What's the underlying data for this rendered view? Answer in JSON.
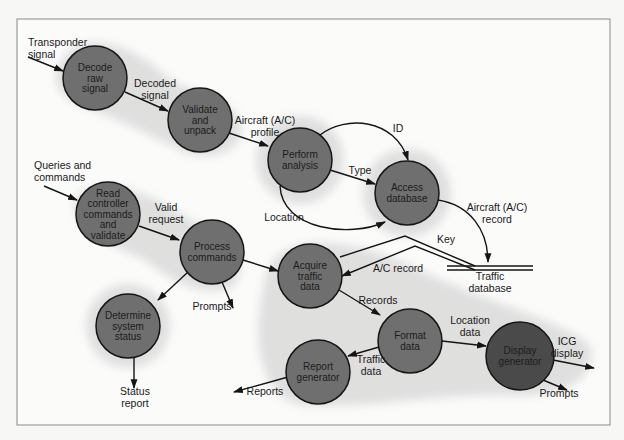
{
  "diagram": {
    "type": "data-flow-diagram",
    "frame": {
      "x": 17,
      "y": 19,
      "w": 593,
      "h": 406
    },
    "colors": {
      "node_fill": "#6f6f6f",
      "node_dark_fill": "#4a4a4a",
      "halo": "#dcdcdc",
      "line": "#151515",
      "background": "#fbfbfa"
    },
    "nodes": [
      {
        "id": "decode",
        "lines": [
          "Decode",
          "raw",
          "signal"
        ],
        "cx": 95,
        "cy": 78,
        "r": 32
      },
      {
        "id": "validate",
        "lines": [
          "Validate",
          "and",
          "unpack"
        ],
        "cx": 200,
        "cy": 120,
        "r": 32
      },
      {
        "id": "analysis",
        "lines": [
          "Perform",
          "analysis"
        ],
        "cx": 300,
        "cy": 160,
        "r": 32
      },
      {
        "id": "access",
        "lines": [
          "Access",
          "database"
        ],
        "cx": 407,
        "cy": 193,
        "r": 32
      },
      {
        "id": "read",
        "lines": [
          "Read",
          "controller",
          "commands",
          "and",
          "validate"
        ],
        "cx": 108,
        "cy": 214,
        "r": 32
      },
      {
        "id": "process",
        "lines": [
          "Process",
          "commands"
        ],
        "cx": 212,
        "cy": 252,
        "r": 32
      },
      {
        "id": "acquire",
        "lines": [
          "Acquire",
          "traffic",
          "data"
        ],
        "cx": 310,
        "cy": 276,
        "r": 32
      },
      {
        "id": "status",
        "lines": [
          "Determine",
          "system",
          "status"
        ],
        "cx": 128,
        "cy": 326,
        "r": 32
      },
      {
        "id": "format",
        "lines": [
          "Format",
          "data"
        ],
        "cx": 410,
        "cy": 341,
        "r": 32
      },
      {
        "id": "report",
        "lines": [
          "Report",
          "generator"
        ],
        "cx": 318,
        "cy": 372,
        "r": 32
      },
      {
        "id": "display",
        "lines": [
          "Display",
          "generator"
        ],
        "cx": 520,
        "cy": 356,
        "r": 34,
        "dark": true
      }
    ],
    "datastore": {
      "label_lines": [
        "Traffic",
        "database"
      ],
      "x1": 447,
      "x2": 533,
      "y1": 266,
      "y2": 270
    },
    "labels": [
      {
        "id": "transponder",
        "lines": [
          "Transponder",
          "signal"
        ],
        "x": 28,
        "y": 46,
        "anchor": "start"
      },
      {
        "id": "decoded",
        "lines": [
          "Decoded",
          "signal"
        ],
        "x": 155,
        "y": 87,
        "anchor": "middle"
      },
      {
        "id": "profile",
        "lines": [
          "Aircraft (A/C)",
          "profile"
        ],
        "x": 265,
        "y": 124,
        "anchor": "middle"
      },
      {
        "id": "id",
        "lines": [
          "ID"
        ],
        "x": 398,
        "y": 132,
        "anchor": "middle"
      },
      {
        "id": "type",
        "lines": [
          "Type"
        ],
        "x": 360,
        "y": 174,
        "anchor": "middle"
      },
      {
        "id": "location",
        "lines": [
          "Location"
        ],
        "x": 284,
        "y": 221,
        "anchor": "middle"
      },
      {
        "id": "queries",
        "lines": [
          "Queries and",
          "commands"
        ],
        "x": 34,
        "y": 169,
        "anchor": "start"
      },
      {
        "id": "valid",
        "lines": [
          "Valid",
          "request"
        ],
        "x": 166,
        "y": 211,
        "anchor": "middle"
      },
      {
        "id": "ac_record_right",
        "lines": [
          "Aircraft (A/C)",
          "record"
        ],
        "x": 497,
        "y": 211,
        "anchor": "middle"
      },
      {
        "id": "key",
        "lines": [
          "Key"
        ],
        "x": 446,
        "y": 243,
        "anchor": "middle"
      },
      {
        "id": "ac_record",
        "lines": [
          "A/C record"
        ],
        "x": 398,
        "y": 272,
        "anchor": "middle"
      },
      {
        "id": "traffic_db",
        "lines": [
          "Traffic",
          "database"
        ],
        "x": 490,
        "y": 280,
        "anchor": "middle"
      },
      {
        "id": "prompts_left",
        "lines": [
          "Prompts"
        ],
        "x": 212,
        "y": 310,
        "anchor": "middle"
      },
      {
        "id": "records",
        "lines": [
          "Records"
        ],
        "x": 378,
        "y": 304,
        "anchor": "middle"
      },
      {
        "id": "location_data",
        "lines": [
          "Location",
          "data"
        ],
        "x": 470,
        "y": 324,
        "anchor": "middle"
      },
      {
        "id": "icg",
        "lines": [
          "ICG",
          "display"
        ],
        "x": 567,
        "y": 345,
        "anchor": "middle"
      },
      {
        "id": "traffic_data",
        "lines": [
          "Traffic",
          "data"
        ],
        "x": 371,
        "y": 363,
        "anchor": "middle"
      },
      {
        "id": "reports",
        "lines": [
          "Reports"
        ],
        "x": 265,
        "y": 395,
        "anchor": "middle"
      },
      {
        "id": "status_report",
        "lines": [
          "Status",
          "report"
        ],
        "x": 135,
        "y": 395,
        "anchor": "middle"
      },
      {
        "id": "prompts_right",
        "lines": [
          "Prompts"
        ],
        "x": 559,
        "y": 397,
        "anchor": "middle"
      }
    ]
  }
}
